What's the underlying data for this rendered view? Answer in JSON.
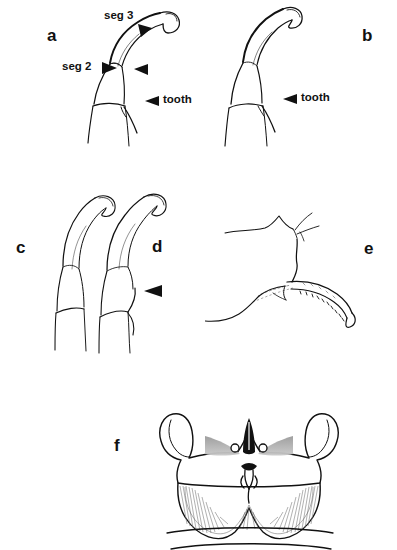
{
  "figure": {
    "type": "scientific-line-drawing-plate",
    "background_color": "#ffffff",
    "ink_color": "#111111",
    "panel_count": 6
  },
  "panels": [
    {
      "id": "a",
      "letter": "a",
      "subject": "maxillary palp lateral view with toothed segment",
      "callouts": [
        {
          "name": "seg-3",
          "text": "seg 3"
        },
        {
          "name": "seg-2",
          "text": "seg 2"
        },
        {
          "name": "tooth",
          "text": "tooth"
        }
      ]
    },
    {
      "id": "b",
      "letter": "b",
      "subject": "maxillary palp lateral view",
      "callouts": [
        {
          "name": "tooth",
          "text": "tooth"
        }
      ]
    },
    {
      "id": "c",
      "letter": "c",
      "subject": "maxillary palp lateral view, untoothed",
      "callouts": []
    },
    {
      "id": "d",
      "letter": "d",
      "subject": "maxillary palp lateral view with arrowhead marker",
      "callouts": []
    },
    {
      "id": "e",
      "letter": "e",
      "subject": "sclerite with stippled digitiform process",
      "callouts": []
    },
    {
      "id": "f",
      "letter": "f",
      "subject": "male genitalia, dorsal view",
      "callouts": []
    }
  ],
  "labels": {
    "seg_3": "seg 3",
    "seg_2": "seg 2",
    "tooth_a": "tooth",
    "tooth_b": "tooth",
    "letter_a": "a",
    "letter_b": "b",
    "letter_c": "c",
    "letter_d": "d",
    "letter_e": "e",
    "letter_f": "f"
  }
}
